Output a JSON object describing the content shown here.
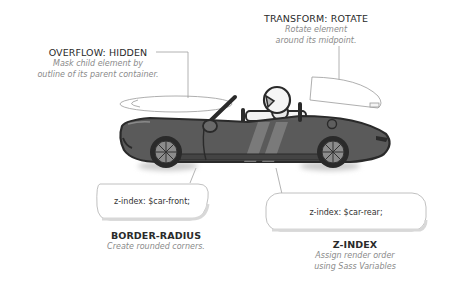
{
  "annotations": {
    "overflow": {
      "title": "OVERFLOW: HIDDEN",
      "desc_line1": "Mask child element by",
      "desc_line2": "outline of its parent container."
    },
    "transform": {
      "title": "TRANSFORM: ROTATE",
      "desc_line1": "Rotate element",
      "desc_line2": "around its midpoint."
    },
    "border_radius": {
      "title": "BORDER-RADIUS",
      "desc_line1": "Create rounded corners."
    },
    "z_index": {
      "title": "Z-INDEX",
      "desc_line1": "Assign render order",
      "desc_line2": "using Sass Variables"
    }
  },
  "pills": {
    "front": "z-index: $car-front;",
    "rear": "z-index: $car-rear;"
  },
  "colors": {
    "car_body": "#5a5a5a",
    "car_outline": "#2a2a2a",
    "stripe": "#7a7a7a",
    "wheel_rim": "#8c8c8c",
    "line": "#9a9a9a"
  }
}
